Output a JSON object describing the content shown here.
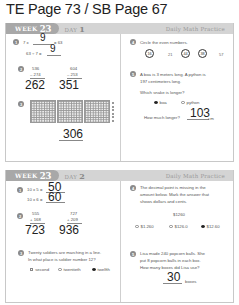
{
  "page_title": "TE Page 73 / SB Page 67",
  "day1": {
    "week_label": "WEEK",
    "week_num": "23",
    "day_label": "DAY",
    "day_num": "1",
    "band_title": "Daily Math Practice",
    "q1": {
      "num": "1",
      "line1": "7 x",
      "ans1": "9",
      "line1_end": "= 63",
      "line2": "63 ÷ 7 =",
      "ans2": "9"
    },
    "q2": {
      "num": "2",
      "a_top": "536",
      "a_bot": "– 274",
      "a_ans": "262",
      "b_top": "604",
      "b_bot": "– 253",
      "b_ans": "351"
    },
    "q3": {
      "num": "3",
      "ans": "306"
    },
    "q4": {
      "num": "4",
      "prompt": "Circle the even numbers.",
      "numbers": [
        {
          "value": "16",
          "circled": true
        },
        {
          "value": "21",
          "circled": false
        },
        {
          "value": "44",
          "circled": true
        },
        {
          "value": "38",
          "circled": true
        },
        {
          "value": "57",
          "circled": false
        }
      ]
    },
    "q5": {
      "num": "5",
      "line1": "A boa is 3 meters long. A python is",
      "line2": "197 centimeters long.",
      "question": "Which snake is longer?",
      "options": [
        {
          "label": "boa",
          "selected": true
        },
        {
          "label": "python",
          "selected": false
        }
      ],
      "how_much": "How much longer?",
      "ans": "103",
      "unit": "cm"
    }
  },
  "day2": {
    "week_label": "WEEK",
    "week_num": "23",
    "day_label": "DAY",
    "day_num": "2",
    "band_title": "Daily Math Practice",
    "q1": {
      "num": "1",
      "line1": "10 x 5 =",
      "ans1": "50",
      "line2": "10 x 6 =",
      "ans2": "60"
    },
    "q2": {
      "num": "2",
      "a_top": "555",
      "a_bot": "+ 168",
      "a_ans": "723",
      "b_top": "727",
      "b_bot": "+ 209",
      "b_ans": "936"
    },
    "q3": {
      "num": "3",
      "line1": "Twenty soldiers are marching in a line.",
      "line2": "In what place is soldier number 12?",
      "options": [
        {
          "label": "second",
          "selected": false
        },
        {
          "label": "twentieth",
          "selected": false
        },
        {
          "label": "twelfth",
          "selected": true
        }
      ]
    },
    "q4": {
      "num": "4",
      "line1": "The decimal point is missing in the",
      "line2": "amount below. Mark the answer that",
      "line3": "shows dollars and cents.",
      "amount": "$1260",
      "options": [
        {
          "label": "$1.260",
          "selected": false
        },
        {
          "label": "$126.0",
          "selected": false
        },
        {
          "label": "$12.60",
          "selected": true
        }
      ]
    },
    "q5": {
      "num": "5",
      "line1": "Lisa made 240 popcorn balls. She",
      "line2": "put 8 popcorn balls in each box.",
      "line3": "How many boxes did Lisa use?",
      "ans": "30",
      "unit": "boxes"
    }
  }
}
